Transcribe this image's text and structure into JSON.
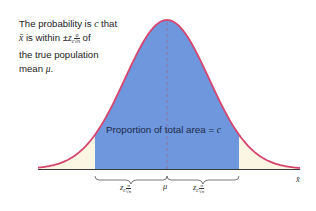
{
  "caption": {
    "line1_prefix": "The probability is ",
    "line1_var": "c",
    "line1_suffix": " that",
    "line2_var": "x̄",
    "line2_mid": " is within ±",
    "line2_z": "z",
    "line2_sub": "c",
    "line2_num": "σ",
    "line2_den": "√n",
    "line2_suffix": "  of",
    "line3": "the true population",
    "line4_prefix": "mean ",
    "line4_var": "μ",
    "line4_suffix": "."
  },
  "area_label": {
    "text": "Proportion of total area = ",
    "var": "c"
  },
  "axis": {
    "x_label": "x̄",
    "center_label": "μ",
    "left_interval": {
      "z": "z",
      "sub": "c",
      "num": "σ",
      "den": "√n"
    },
    "right_interval": {
      "z": "z",
      "sub": "c",
      "num": "σ",
      "den": "√n"
    }
  },
  "colors": {
    "curve": "#d6456e",
    "center_area": "#6e97de",
    "tail_area": "#fbf6e4",
    "axis": "#3a3a3a"
  }
}
